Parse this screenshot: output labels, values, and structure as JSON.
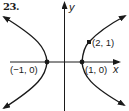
{
  "problem": {
    "number": "23."
  },
  "axes": {
    "x_label": "x",
    "y_label": "y"
  },
  "points": [
    {
      "label": "(−1, 0)",
      "x": -1,
      "y": 0
    },
    {
      "label": "(1, 0)",
      "x": 1,
      "y": 0
    },
    {
      "label": "(2, 1)",
      "x": 2,
      "y": 1
    }
  ],
  "curve": {
    "type": "hyperbola",
    "orientation": "horizontal transverse axis",
    "vertices": [
      "(−1, 0)",
      "(1, 0)"
    ],
    "point_on_curve": "(2, 1)",
    "inferred_equation": "x² − 3y² = 1"
  },
  "colors": {
    "ink": "#1a1a1a",
    "background": "#ffffff"
  }
}
